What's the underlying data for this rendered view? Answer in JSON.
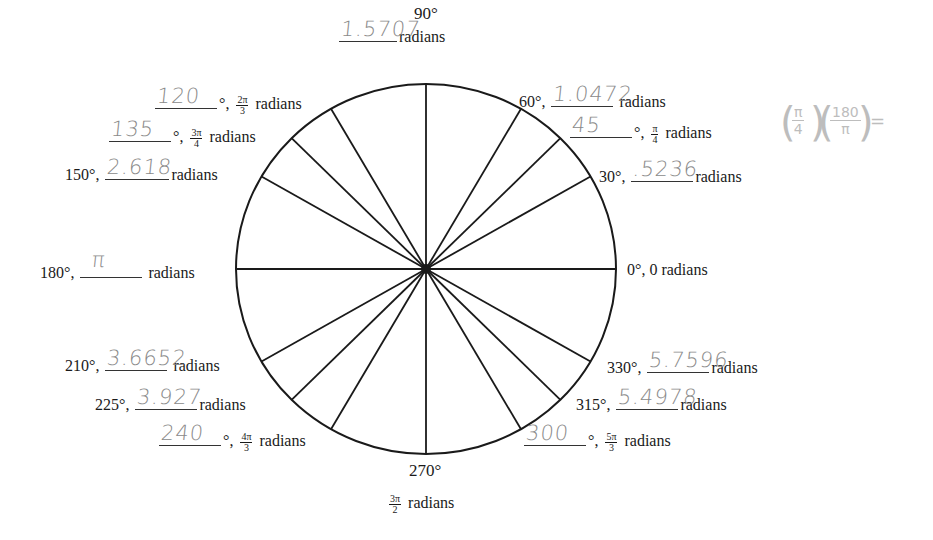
{
  "diagram": {
    "center": {
      "x": 426,
      "y": 269
    },
    "radius": {
      "rx": 190,
      "ry": 185
    },
    "stroke_color": "#1a1a1a",
    "handwriting_color": "#8a8a8a",
    "spoke_angles_deg": [
      0,
      30,
      45,
      60,
      90,
      120,
      135,
      150,
      180,
      210,
      225,
      240,
      270,
      300,
      315,
      330
    ]
  },
  "labels": {
    "deg90": {
      "deg": "90°",
      "answer": "1.5707",
      "suffix": "radians"
    },
    "deg60": {
      "prefix": "60°,",
      "answer": "1.0472",
      "suffix": "radians"
    },
    "deg45": {
      "answer": "45",
      "sep": "°,",
      "num": "π",
      "den": "4",
      "suffix": "radians"
    },
    "deg30": {
      "prefix": "30°,",
      "answer": ".5236",
      "suffix": "radians"
    },
    "deg0": {
      "text": "0°, 0 radians"
    },
    "deg120": {
      "answer": "120",
      "sep": "°,",
      "num": "2π",
      "den": "3",
      "suffix": "radians"
    },
    "deg135": {
      "answer": "135",
      "sep": "°,",
      "num": "3π",
      "den": "4",
      "suffix": "radians"
    },
    "deg150": {
      "prefix": "150°,",
      "answer": "2.618",
      "suffix": "radians"
    },
    "deg180": {
      "prefix": "180°,",
      "answer": "π",
      "suffix": "radians"
    },
    "deg210": {
      "prefix": "210°,",
      "answer": "3.6652",
      "suffix": "radians"
    },
    "deg225": {
      "prefix": "225°,",
      "answer": "3.927",
      "suffix": "radians"
    },
    "deg240": {
      "answer": "240",
      "sep": "°,",
      "num": "4π",
      "den": "3",
      "suffix": "radians"
    },
    "deg270": {
      "deg": "270°",
      "num": "3π",
      "den": "2",
      "suffix": "radians"
    },
    "deg300": {
      "answer": "300",
      "sep": "°,",
      "num": "5π",
      "den": "3",
      "suffix": "radians"
    },
    "deg315": {
      "prefix": "315°,",
      "answer": "5.4978",
      "suffix": "radians"
    },
    "deg330": {
      "prefix": "330°,",
      "answer": "5.7596",
      "suffix": "radians"
    }
  },
  "side_note": {
    "frac1_num": "π",
    "frac1_den": "4",
    "frac2_num": "180",
    "frac2_den": "π",
    "equals": "="
  }
}
